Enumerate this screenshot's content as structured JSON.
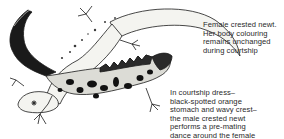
{
  "illustration": {
    "subject": "Two crested newts during courtship",
    "figures": [
      "female-crested-newt",
      "male-crested-newt"
    ]
  },
  "captions": {
    "female": {
      "lines": [
        "Female crested newt.",
        "Her body colouring",
        "remains unchanged",
        "during courtship"
      ]
    },
    "male": {
      "lines": [
        "In courtship dress–",
        "black-spotted orange",
        "stomach and wavy crest–",
        "the male crested newt",
        "performs a pre-mating",
        "dance around the female"
      ]
    }
  },
  "colors": {
    "ink": "#1a1a1a",
    "female_body": "#f2f2ee",
    "male_belly": "#d8d8d2",
    "spots": "#111111"
  }
}
